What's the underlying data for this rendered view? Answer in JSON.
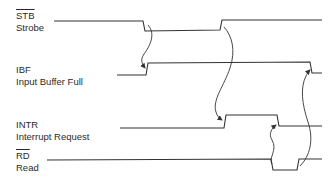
{
  "diagram": {
    "type": "timing-diagram",
    "signals": [
      {
        "id": "stb",
        "name": "STB",
        "active_low": true,
        "description": "Strobe"
      },
      {
        "id": "ibf",
        "name": "IBF",
        "active_low": false,
        "description": "Input Buffer Full"
      },
      {
        "id": "intr",
        "name": "INTR",
        "active_low": false,
        "description": "Interrupt Request"
      },
      {
        "id": "rd",
        "name": "RD",
        "active_low": true,
        "description": "Read"
      }
    ],
    "causal_arrows": [
      {
        "from": "STB falling edge",
        "to": "IBF rising edge"
      },
      {
        "from": "STB rising edge",
        "to": "INTR rising edge"
      },
      {
        "from": "RD falling edge",
        "to": "INTR falling edge"
      },
      {
        "from": "RD rising edge",
        "to": "IBF falling edge"
      }
    ],
    "line_color": "#333333"
  }
}
